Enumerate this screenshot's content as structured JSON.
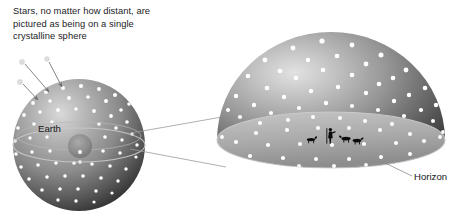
{
  "figure": {
    "background_color": "#ffffff",
    "annotations": {
      "caption": "Stars, no matter how distant, are\npictured as being on a single\ncrystalline sphere",
      "earth_label": "Earth",
      "horizon_label": "Horizon"
    },
    "colors": {
      "sphere_light": "#d2d2d2",
      "sphere_mid": "#8e8e8e",
      "sphere_dark": "#3a3a3a",
      "ground_light": "#bcbcbc",
      "ground_dark": "#8a8a8a",
      "star": "#ffffff",
      "line": "#7d7d7d",
      "text": "#1d1d1f",
      "silhouette": "#0b0b0b"
    },
    "small_sphere": {
      "name": "celestial-sphere-small",
      "center_x": 79,
      "center_y": 145,
      "radius": 66,
      "inner_earth": {
        "center_x": 80,
        "center_y": 146,
        "radius": 12
      },
      "horizon_ring": {
        "cx": 79,
        "cy": 145,
        "rx": 66,
        "ry": 17
      }
    },
    "large_dome": {
      "name": "celestial-dome-large",
      "center_x": 331,
      "base_y": 140,
      "radius_x": 114,
      "radius_y": 108,
      "ground_ellipse": {
        "cx": 331,
        "cy": 140,
        "rx": 114,
        "ry": 28
      }
    },
    "incoming_star_arrows": [
      {
        "star_x": 22,
        "star_y": 62,
        "tip_x": 50,
        "tip_y": 93
      },
      {
        "star_x": 47,
        "star_y": 59,
        "tip_x": 63,
        "tip_y": 88
      },
      {
        "star_x": 20,
        "star_y": 82,
        "tip_x": 39,
        "tip_y": 101
      }
    ],
    "connector_lines": [
      {
        "from_x": 131,
        "from_y": 133,
        "to_x": 222,
        "to_y": 117
      },
      {
        "from_x": 131,
        "from_y": 149,
        "to_x": 225,
        "to_y": 166
      }
    ],
    "horizon_leader": {
      "from_x": 410,
      "from_y": 160,
      "to_x": 383,
      "to_y": 176
    },
    "ground_figures": [
      {
        "kind": "dog-silhouette",
        "x": 311,
        "y": 140
      },
      {
        "kind": "shepherd-silhouette",
        "x": 330,
        "y": 131
      },
      {
        "kind": "sheep-silhouette",
        "x": 345,
        "y": 139
      },
      {
        "kind": "sheep-silhouette",
        "x": 355,
        "y": 141
      }
    ]
  }
}
